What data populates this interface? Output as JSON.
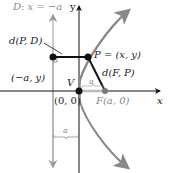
{
  "diagram": {
    "labels": {
      "directrix": "D: x = −a",
      "y_axis": "y",
      "x_axis": "x",
      "dist_PD": "d(P, D)",
      "point_P": "P = (x, y)",
      "dist_FP": "d(F, P)",
      "point_directrix": "(−a, y)",
      "vertex": "V",
      "origin": "(0, 0)",
      "focus": "F(a, 0)",
      "a_top": "a",
      "a_bottom": "a"
    },
    "colors": {
      "axis": "#111111",
      "directrix": "#aaaaaa",
      "parabola": "#888888",
      "segment": "#111111",
      "focus_point": "#777777"
    }
  }
}
